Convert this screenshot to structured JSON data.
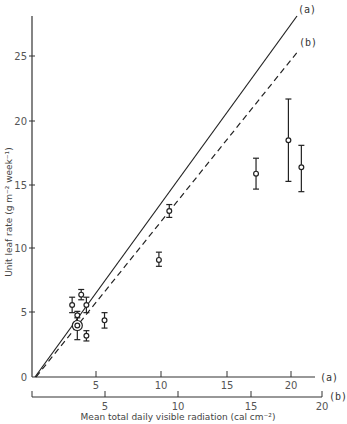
{
  "chart_data": {
    "type": "scatter",
    "title": "",
    "xlabel": "Mean total daily visible radiation (cal cm⁻²)",
    "ylabel": "Unit leaf rate (g m⁻² week⁻¹)",
    "xlim": [
      0,
      22
    ],
    "ylim": [
      0,
      28
    ],
    "grid": false,
    "y_ticks": [
      0,
      5,
      10,
      15,
      20,
      25
    ],
    "x_axes": [
      {
        "id": "a",
        "label": "(a)",
        "ticks": [
          5,
          10,
          15,
          20
        ],
        "range": [
          0,
          22
        ]
      },
      {
        "id": "b",
        "label": "(b)",
        "ticks": [
          5,
          10,
          15,
          20
        ],
        "range": [
          0,
          20
        ]
      }
    ],
    "lines": [
      {
        "name": "(a)",
        "style": "solid",
        "x": [
          0.3,
          20.7
        ],
        "y": [
          0,
          28
        ]
      },
      {
        "name": "(b)",
        "style": "dashed",
        "x": [
          0.3,
          20.7
        ],
        "y": [
          0,
          25.4
        ]
      }
    ],
    "series": [
      {
        "name": "observations",
        "marker": "open-circle-with-error-bars",
        "points": [
          {
            "x": 3.1,
            "y": 5.6,
            "ylo": 5.0,
            "yhi": 6.2
          },
          {
            "x": 3.8,
            "y": 6.4,
            "ylo": 6.0,
            "yhi": 6.8
          },
          {
            "x": 4.2,
            "y": 5.6,
            "ylo": 5.0,
            "yhi": 6.2
          },
          {
            "x": 3.5,
            "y": 4.8,
            "ylo": 4.3,
            "yhi": 5.1
          },
          {
            "x": 3.5,
            "y": 4.0,
            "ylo": 2.9,
            "yhi": 4.6,
            "circled": true
          },
          {
            "x": 4.2,
            "y": 3.2,
            "ylo": 2.8,
            "yhi": 3.6
          },
          {
            "x": 5.6,
            "y": 4.4,
            "ylo": 3.8,
            "yhi": 5.0
          },
          {
            "x": 9.8,
            "y": 9.1,
            "ylo": 8.6,
            "yhi": 9.7
          },
          {
            "x": 10.6,
            "y": 12.9,
            "ylo": 12.4,
            "yhi": 13.4
          },
          {
            "x": 17.3,
            "y": 15.8,
            "ylo": 14.6,
            "yhi": 17.0
          },
          {
            "x": 19.8,
            "y": 18.4,
            "ylo": 15.2,
            "yhi": 21.6
          },
          {
            "x": 20.8,
            "y": 16.3,
            "ylo": 14.4,
            "yhi": 18.0
          }
        ]
      }
    ],
    "annotations": [
      "(a)",
      "(b)"
    ],
    "legend": "none (lines labelled inline at top right)"
  },
  "labels": {
    "ylabel": "Unit leaf rate (g m⁻² week⁻¹)",
    "xlabel": "Mean total daily visible radiation (cal cm⁻²)",
    "line_a": "(a)",
    "line_b": "(b)",
    "axis_a": "(a)",
    "axis_b": "(b)",
    "origin": "0",
    "y_ticks": [
      "5",
      "10",
      "15",
      "20",
      "25"
    ],
    "xa_ticks": [
      "5",
      "10",
      "15",
      "20"
    ],
    "xb_ticks": [
      "5",
      "10",
      "15",
      "20"
    ]
  }
}
